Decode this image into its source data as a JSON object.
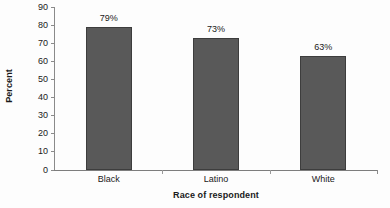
{
  "chart_data": {
    "type": "bar",
    "title": "",
    "subtitle": "",
    "xlabel": "Race of respondent",
    "ylabel": "Percent",
    "categories": [
      "Black",
      "Latino",
      "White"
    ],
    "values": [
      79,
      73,
      63
    ],
    "data_labels": [
      "79%",
      "73%",
      "63%"
    ],
    "ylim": [
      0,
      90
    ],
    "ytick_step": 10,
    "ytick_labels": [
      "0",
      "10",
      "20",
      "30",
      "40",
      "50",
      "60",
      "70",
      "80",
      "90"
    ],
    "grid": false,
    "legend": null,
    "legend_position": "none",
    "series": [
      {
        "name": "Percent",
        "values": [
          79,
          73,
          63
        ],
        "color": "#595959",
        "border_color": "#3d3d3d"
      }
    ],
    "annotations": []
  },
  "colors": {
    "background": "#fdfdfd",
    "bar_fill": "#595959",
    "bar_border": "#3d3d3d",
    "axis_line": "#8a8a8a",
    "text": "#1a1a1a"
  }
}
